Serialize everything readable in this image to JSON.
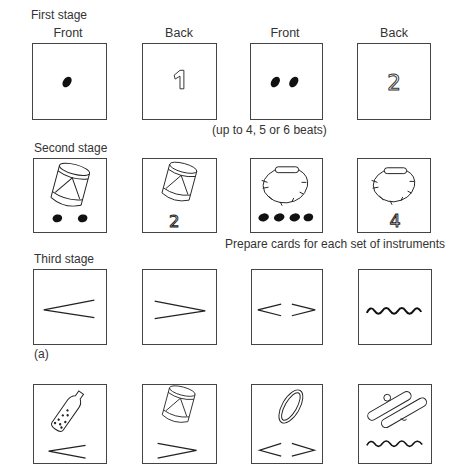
{
  "stages": {
    "first": {
      "title": "First stage",
      "column_headers": [
        "Front",
        "Back",
        "Front",
        "Back"
      ],
      "cards": [
        {
          "side": "Front",
          "content": "1 beat dot"
        },
        {
          "side": "Back",
          "content": "1"
        },
        {
          "side": "Front",
          "content": "2 beat dots"
        },
        {
          "side": "Back",
          "content": "2"
        }
      ],
      "note": "(up to 4, 5 or 6 beats)"
    },
    "second": {
      "title": "Second stage",
      "cards": [
        {
          "content": "drum with 2 beat dots"
        },
        {
          "content": "drum with number",
          "number": "2"
        },
        {
          "content": "jingle ring with 4 beat dots"
        },
        {
          "content": "jingle ring with number",
          "number": "4"
        }
      ],
      "note": "Prepare cards for each set of instruments"
    },
    "third": {
      "title": "Third stage",
      "cards_a": [
        {
          "symbol": "crescendo"
        },
        {
          "symbol": "decrescendo"
        },
        {
          "symbol": "crescendo-decrescendo"
        },
        {
          "symbol": "wavy-line"
        }
      ],
      "label_a": "(a)",
      "cards_b": [
        {
          "instrument": "shaker bottle",
          "symbol": "crescendo"
        },
        {
          "instrument": "drum",
          "symbol": "decrescendo"
        },
        {
          "instrument": "tambourine ring",
          "symbol": "crescendo-decrescendo"
        },
        {
          "instrument": "claves",
          "symbol": "wavy-line"
        }
      ]
    }
  },
  "colors": {
    "ink": "#222222",
    "border": "#444444",
    "background": "#ffffff"
  }
}
